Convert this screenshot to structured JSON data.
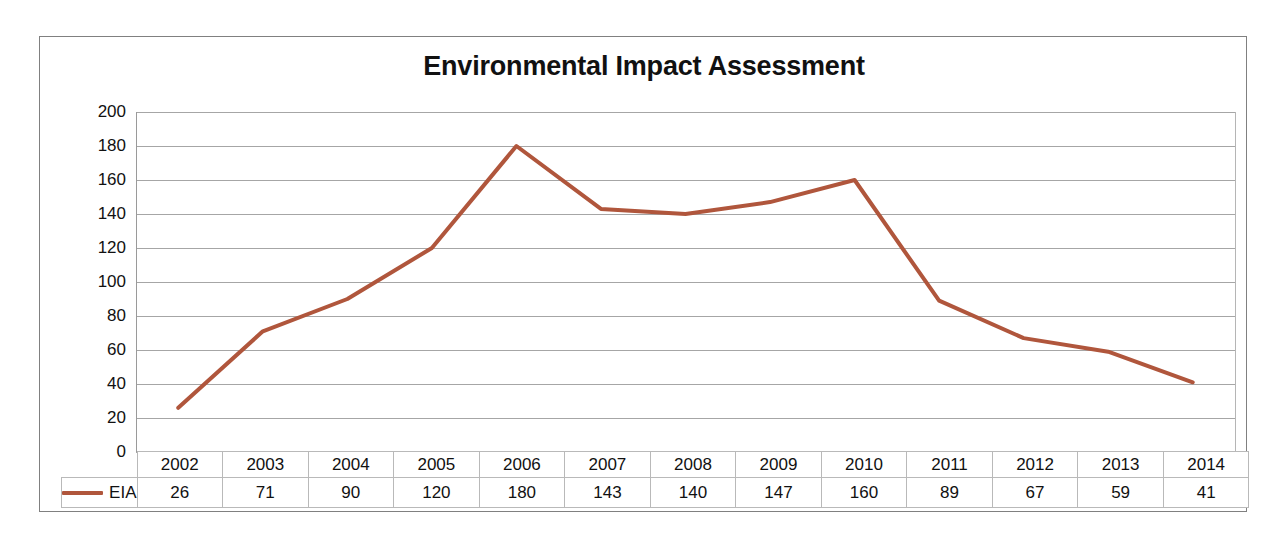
{
  "chart": {
    "title": "Environmental Impact Assessment",
    "line_color": "#B0563C",
    "grid_color": "#A6A6A6",
    "border_color": "#808080",
    "text_color": "#111111"
  },
  "legend": {
    "series_label": "EIA",
    "swatch_icon": "line-swatch-icon"
  },
  "chart_data": {
    "type": "line",
    "title": "Environmental Impact Assessment",
    "xlabel": "",
    "ylabel": "",
    "ylim": [
      0,
      200
    ],
    "ytick_step": 20,
    "yticks": [
      200,
      180,
      160,
      140,
      120,
      100,
      80,
      60,
      40,
      20,
      0
    ],
    "ytick_labels": [
      "200",
      "180",
      "160",
      "140",
      "120",
      "100",
      "80",
      "60",
      "40",
      "20",
      "0"
    ],
    "grid": true,
    "grid_axis": "y",
    "legend": "bottom-table",
    "categories": [
      "2002",
      "2003",
      "2004",
      "2005",
      "2006",
      "2007",
      "2008",
      "2009",
      "2010",
      "2011",
      "2012",
      "2013",
      "2014"
    ],
    "series": [
      {
        "name": "EIA",
        "color": "#B0563C",
        "values": [
          26,
          71,
          90,
          120,
          180,
          143,
          140,
          147,
          160,
          89,
          67,
          59,
          41
        ],
        "value_labels": [
          "26",
          "71",
          "90",
          "120",
          "180",
          "143",
          "140",
          "147",
          "160",
          "89",
          "67",
          "59",
          "41"
        ]
      }
    ]
  },
  "table": {
    "years": [
      "2002",
      "2003",
      "2004",
      "2005",
      "2006",
      "2007",
      "2008",
      "2009",
      "2010",
      "2011",
      "2012",
      "2013",
      "2014"
    ],
    "values": [
      "26",
      "71",
      "90",
      "120",
      "180",
      "143",
      "140",
      "147",
      "160",
      "89",
      "67",
      "59",
      "41"
    ]
  }
}
